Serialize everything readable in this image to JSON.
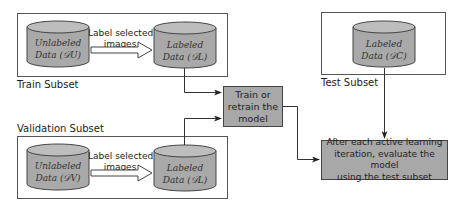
{
  "diagram": {
    "train_subset": {
      "label": "Train Subset",
      "unlabeled": {
        "line1": "Unlabeled",
        "line2": "Data (𝒟U)"
      },
      "arrow_label": {
        "line1": "Label selected",
        "line2": "images"
      },
      "labeled": {
        "line1": "Labeled",
        "line2": "Data (𝒟L)"
      }
    },
    "validation_subset": {
      "label": "Validation Subset",
      "unlabeled": {
        "line1": "Unlabeled",
        "line2": "Data (𝒟V)"
      },
      "arrow_label": {
        "line1": "Label selected",
        "line2": "images"
      },
      "labeled": {
        "line1": "Labeled",
        "line2": "Data (𝒟L)"
      }
    },
    "test_subset": {
      "label": "Test Subset",
      "labeled": {
        "line1": "Labeled",
        "line2": "Data (𝒟C)"
      }
    },
    "train_process": {
      "line1": "Train or",
      "line2": "retrain the",
      "line3": "model"
    },
    "eval_process": {
      "line1": "After each active learning",
      "line2": "iteration, evaluate the model",
      "line3": "using the test subset"
    },
    "colors": {
      "cylinder_fill": "#a9a9a9",
      "cylinder_top": "#bdbdbd",
      "process_fill": "#a8a8a8",
      "border": "#444444"
    }
  }
}
